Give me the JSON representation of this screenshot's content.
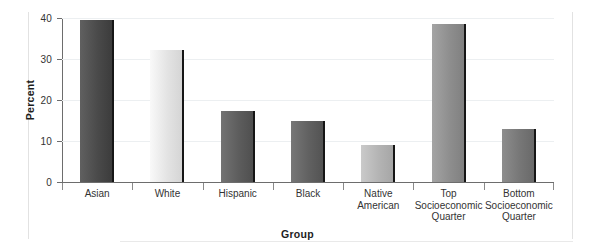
{
  "chart_data": {
    "type": "bar",
    "title": "",
    "xlabel": "Group",
    "ylabel": "Percent",
    "categories": [
      "Asian",
      "White",
      "Hispanic",
      "Black",
      "Native American",
      "Top\nSocioeconomic\nQuarter",
      "Bottom\nSocioeconomic\nQuarter"
    ],
    "values": [
      39.5,
      32.2,
      17.3,
      15.0,
      9.0,
      38.5,
      13.0
    ],
    "ylim": [
      0,
      40
    ],
    "yticks": [
      0,
      10,
      20,
      30,
      40
    ],
    "ytick_labels": [
      "0",
      "10",
      "20",
      "30",
      "40"
    ],
    "grid": true,
    "legend": "none",
    "bar_colors": [
      "#4a4a4a",
      "#e3e3e3",
      "#5d5d5d",
      "#616161",
      "#b4b4b4",
      "#8e8e8e",
      "#777777"
    ],
    "bar_edge_color": "#161616",
    "axis_color": "#6d6d6d",
    "gridline_color": "#eceff1"
  }
}
